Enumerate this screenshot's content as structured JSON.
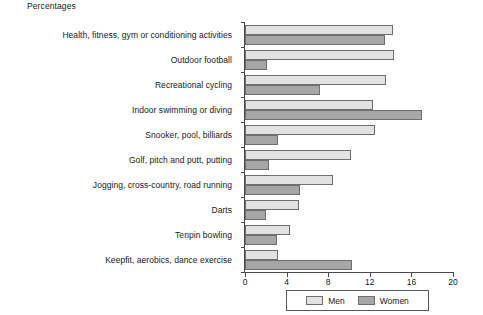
{
  "chart_data": {
    "type": "bar",
    "orientation": "horizontal",
    "title": "Percentages",
    "xlabel": "",
    "ylabel": "",
    "xlim": [
      0,
      20
    ],
    "xticks": [
      0,
      4,
      8,
      12,
      16,
      20
    ],
    "grid": false,
    "legend_position": "bottom",
    "categories": [
      "Health, fitness, gym or conditioning activities",
      "Outdoor football",
      "Recreational cycling",
      "Indoor swimming or diving",
      "Snooker, pool, billiards",
      "Golf, pitch and putt, putting",
      "Jogging, cross-country, road running",
      "Darts",
      "Tenpin bowling",
      "Keepfit, aerobics, dance exercise"
    ],
    "series": [
      {
        "name": "Men",
        "color": "#e2e2e2",
        "values": [
          14.2,
          14.3,
          13.6,
          12.3,
          12.5,
          10.2,
          8.5,
          5.2,
          4.3,
          3.2
        ]
      },
      {
        "name": "Women",
        "color": "#a6a6a6",
        "values": [
          13.5,
          2.1,
          7.2,
          17.0,
          3.2,
          2.3,
          5.3,
          2.0,
          3.1,
          10.3
        ]
      }
    ]
  }
}
